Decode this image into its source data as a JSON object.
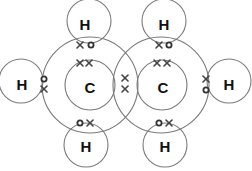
{
  "diagram": {
    "title": "",
    "colors": {
      "shell": "#7a7a7a",
      "label": "#111111",
      "electron": "#444444"
    },
    "atoms": {
      "carbon_left": {
        "label": "C"
      },
      "carbon_right": {
        "label": "C"
      },
      "h_top_left": {
        "label": "H"
      },
      "h_top_right": {
        "label": "H"
      },
      "h_left": {
        "label": "H"
      },
      "h_right": {
        "label": "H"
      },
      "h_bottom_left": {
        "label": "H"
      },
      "h_bottom_right": {
        "label": "H"
      }
    },
    "electron_symbols": {
      "carbon": "cross",
      "hydrogen": "dot"
    }
  }
}
